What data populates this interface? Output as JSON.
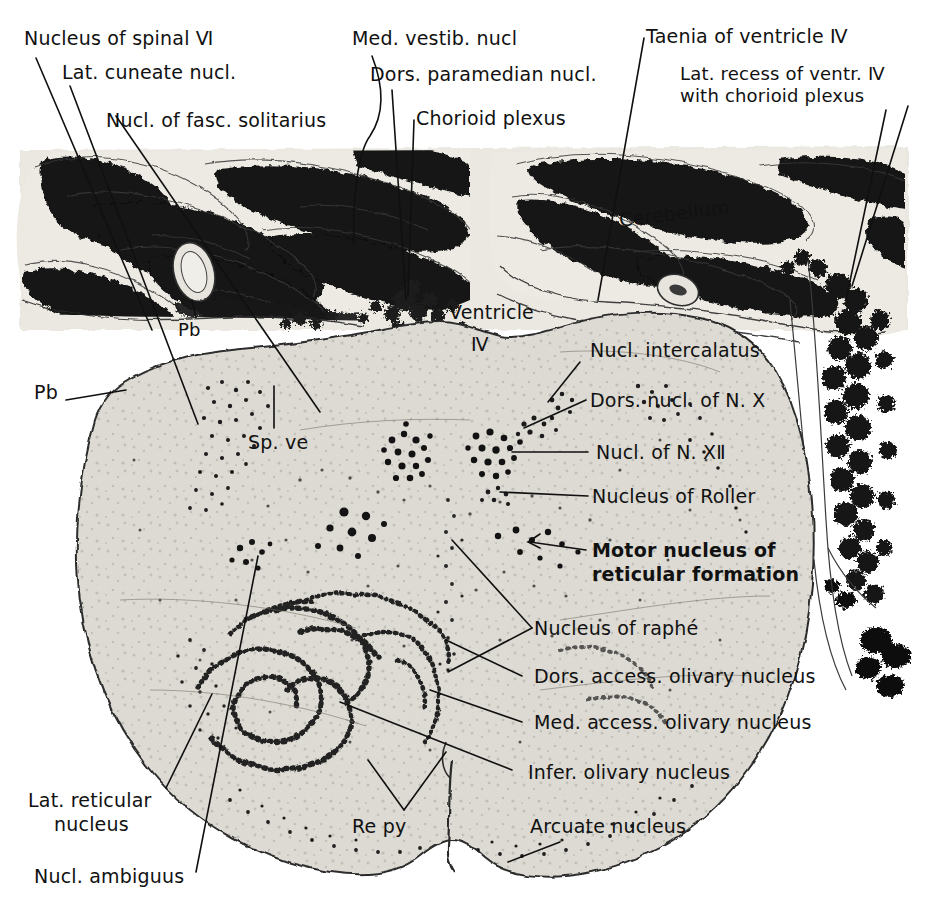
{
  "figure": {
    "ink_color": "#111111",
    "tissue_color": "#d8d6cf",
    "dark_color": "#101010",
    "background": "#ffffff"
  },
  "labels": {
    "nucleus_spinal_v": "Nucleus of spinal Ⅵ",
    "lat_cuneate": "Lat. cuneate nucl.",
    "nucl_fasc_solitarius": "Nucl. of fasc. solitarius",
    "med_vestib": "Med. vestib. nucl",
    "dors_paramedian": "Dors. paramedian nucl.",
    "chorioid_plexus": "Chorioid plexus",
    "taenia": "Taenia of ventricle Ⅳ",
    "lat_recess_line1": "Lat. recess of ventr. Ⅳ",
    "lat_recess_line2": "with chorioid plexus",
    "cerebellum": "Cerebellum",
    "ventricle_word": "Ventricle",
    "ventricle_num": "Ⅳ",
    "pb_inner": "Pb",
    "pb_outer": "Pb",
    "sp_ve": "Sp. ve",
    "nucl_intercalatus": "Nucl. intercalatus",
    "dors_nucl_x": "Dors. nucl. of N. Ⅹ",
    "nucl_xii": "Nucl. of N. ⅩⅡ",
    "nucleus_roller": "Nucleus of Roller",
    "motor_nucleus_line1": "Motor nucleus of",
    "motor_nucleus_line2": "reticular formation",
    "nucleus_raphe": "Nucleus of raphé",
    "dors_access_olivary": "Dors. access. olivary nucleus",
    "med_access_olivary": "Med. access. olivary nucleus",
    "infer_olivary_a": "Infer. olivary ",
    "infer_olivary_b": "nucleus",
    "arcuate_a": "Arcuate ",
    "arcuate_b": "nucleus",
    "re_py": "Re py",
    "lat_reticular_line1": "Lat. reticular",
    "lat_reticular_line2": "nucleus",
    "nucl_ambiguus": "Nucl. ambiguus"
  }
}
